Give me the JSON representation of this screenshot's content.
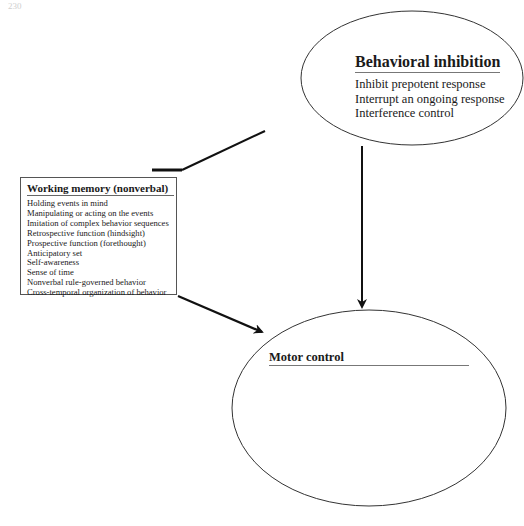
{
  "page_number": "230",
  "diagram": {
    "behavioral_inhibition": {
      "title": "Behavioral inhibition",
      "items": [
        "Inhibit prepotent response",
        "Interrupt an ongoing response",
        "Interference control"
      ]
    },
    "working_memory": {
      "title": "Working memory (nonverbal)",
      "items": [
        "Holding events in mind",
        "Manipulating or acting on the events",
        "Imitation of complex behavior sequences",
        "Retrospective function (hindsight)",
        "Prospective function (forethought)",
        "Anticipatory set",
        "Self-awareness",
        "Sense of time",
        "Nonverbal rule-governed behavior",
        "Cross-temporal organization of behavior"
      ]
    },
    "motor_control": {
      "title": "Motor control"
    },
    "connections": [
      {
        "from": "behavioral_inhibition",
        "to": "working_memory",
        "type": "line"
      },
      {
        "from": "behavioral_inhibition",
        "to": "motor_control",
        "type": "arrow"
      },
      {
        "from": "working_memory",
        "to": "motor_control",
        "type": "arrow"
      }
    ],
    "colors": {
      "stroke": "#222222",
      "background": "#ffffff"
    }
  }
}
